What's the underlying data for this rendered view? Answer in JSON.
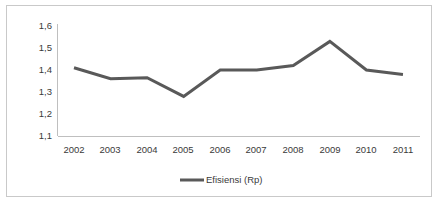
{
  "chart_data": {
    "type": "line",
    "title": "",
    "xlabel": "",
    "ylabel": "",
    "categories": [
      "2002",
      "2003",
      "2004",
      "2005",
      "2006",
      "2007",
      "2008",
      "2009",
      "2010",
      "2011"
    ],
    "series": [
      {
        "name": "Efisiensi (Rp)",
        "color": "#595959",
        "values": [
          1.41,
          1.36,
          1.365,
          1.28,
          1.4,
          1.4,
          1.42,
          1.53,
          1.4,
          1.38
        ]
      }
    ],
    "ylim": [
      1.1,
      1.6
    ],
    "ytick_values": [
      1.6,
      1.5,
      1.4,
      1.3,
      1.2,
      1.1
    ],
    "ytick_labels": [
      "1,6",
      "1,5",
      "1,4",
      "1,3",
      "1,2",
      "1,1"
    ],
    "xtick_labels": [
      "2002",
      "2003",
      "2004",
      "2005",
      "2006",
      "2007",
      "2008",
      "2009",
      "2010",
      "2011"
    ],
    "grid": false,
    "legend_position": "bottom",
    "legend_entries": [
      "Efisiensi (Rp)"
    ],
    "decimal_separator": ",",
    "border_color": "#c9c9c9",
    "axis_color": "#bfbfbf",
    "background_color": "#ffffff",
    "text_color": "#3a3a3a"
  },
  "legend": {
    "entry_label": "Efisiensi (Rp)"
  }
}
